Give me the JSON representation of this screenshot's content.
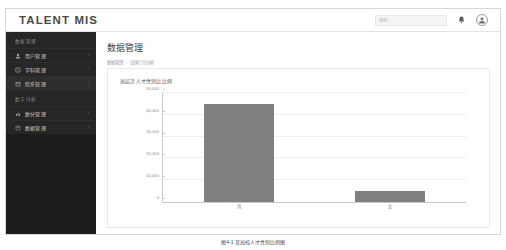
{
  "header": {
    "brand": "TALENT MIS",
    "search_placeholder": "搜索...",
    "bell_icon": "bell-icon",
    "avatar_icon": "user-avatar-icon"
  },
  "sidebar": {
    "groups": [
      {
        "title": "数据管理",
        "items": [
          {
            "label": "用户管理",
            "icon": "user-icon",
            "chevron": "›",
            "active": false
          },
          {
            "label": "学科管理",
            "icon": "book-icon",
            "chevron": "›",
            "active": false
          },
          {
            "label": "院系管理",
            "icon": "building-icon",
            "chevron": "›",
            "active": true
          }
        ]
      },
      {
        "title": "数字分析",
        "items": [
          {
            "label": "数分管理",
            "icon": "chart-icon",
            "chevron": "›",
            "active": false
          },
          {
            "label": "数据管理",
            "icon": "database-icon",
            "chevron": "›",
            "active": false
          }
        ]
      }
    ]
  },
  "main": {
    "page_title": "数据管理",
    "breadcrumb": [
      "数据管理",
      "出国行为分析"
    ],
    "breadcrumb_separator": "/",
    "card_title": "高层次人才性别比比例"
  },
  "caption": "图4-1 某高校人才性别比例图",
  "colors": {
    "bar": "#808080",
    "sidebar": "#1c1c1c",
    "sidebar_item": "#262626",
    "axis": "#c8c8c8",
    "grid": "#eeeeee"
  },
  "chart_data": {
    "type": "bar",
    "title": "高层次人才性别比比例",
    "categories": [
      "男",
      "女"
    ],
    "values": [
      45000,
      5000
    ],
    "xlabel": "",
    "ylabel": "",
    "ylim": [
      0,
      50000
    ],
    "yticks": [
      0,
      10000,
      20000,
      30000,
      40000,
      50000
    ],
    "ytick_labels": [
      "0",
      "10,000",
      "20,000",
      "30,000",
      "40,000",
      "50,000"
    ],
    "grid": true,
    "legend": false
  }
}
